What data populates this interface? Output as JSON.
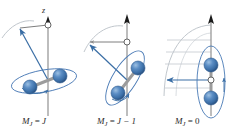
{
  "figure": {
    "title": "",
    "background_color": "#ffffff",
    "width": 241,
    "height": 134
  },
  "colors": {
    "sphere_fill": "#3f74ad",
    "sphere_highlight": "#86aed6",
    "sphere_shadow": "#2b5686",
    "sphere_edge": "#2d5a8e",
    "bond_rod": "#8e8e8e",
    "axis_line": "#8c8c8c",
    "arrowhead_black": "#1a1a1a",
    "vector_blue": "#3a6ea5",
    "ellipse_blue": "#4a7ab5",
    "precession_gray": "#b9bfc6",
    "text": "#2b2b2b",
    "open_circle_fill": "#ffffff"
  },
  "axis": {
    "label": "z",
    "label_x": 46,
    "label_y": 12
  },
  "panels": [
    {
      "id": "panel-mj-equals-j",
      "index": 0,
      "label_parts": {
        "symbol": "M",
        "subscript": "J",
        "equals": " = ",
        "value": "J"
      },
      "label_text": "M J  =  J",
      "label_x": 22,
      "label_y": 124,
      "quantum_number": "M_J = J",
      "origin_x": 48,
      "origin_y": 80,
      "axis_top_y": 20,
      "axis_bottom_y": 116,
      "vector_tip_x": 17,
      "vector_tip_y": 30,
      "ellipse_rx": 33,
      "ellipse_ry": 11,
      "ellipse_rotation": -10,
      "ellipse_cx": 44,
      "ellipse_cy": 81,
      "sphere_a": {
        "cx": 30,
        "cy": 87,
        "r": 7
      },
      "sphere_b": {
        "cx": 60,
        "cy": 76,
        "r": 7
      },
      "open_circle": {
        "cx": 48,
        "cy": 25,
        "r": 3
      },
      "precession_arc": "M2,38 C10,26 22,19 34,21",
      "tilt_degrees": "large"
    },
    {
      "id": "panel-mj-equals-j-minus-1",
      "index": 1,
      "label_parts": {
        "symbol": "M",
        "subscript": "J",
        "equals": " = ",
        "value": "J − 1"
      },
      "label_text": "M J  =  J − 1",
      "label_x": 97,
      "label_y": 124,
      "quantum_number": "M_J = J - 1",
      "origin_x": 127,
      "origin_y": 80,
      "axis_top_y": 18,
      "axis_bottom_y": 116,
      "vector_tip_x": 86,
      "vector_tip_y": 44,
      "ellipse_rx": 31,
      "ellipse_ry": 12,
      "ellipse_rotation": -58,
      "ellipse_cx": 125,
      "ellipse_cy": 78,
      "sphere_a": {
        "cx": 118,
        "cy": 93,
        "r": 7
      },
      "sphere_b": {
        "cx": 138,
        "cy": 68,
        "r": 7
      },
      "open_circle": {
        "cx": 127,
        "cy": 42,
        "r": 3
      },
      "precession_arc": "M84,52 C92,34 108,24 123,26",
      "tilt_degrees": "medium"
    },
    {
      "id": "panel-mj-equals-0",
      "index": 2,
      "label_parts": {
        "symbol": "M",
        "subscript": "J",
        "equals": " = ",
        "value": "0"
      },
      "label_text": "M J  =  0",
      "label_x": 175,
      "label_y": 124,
      "quantum_number": "M_J = 0",
      "origin_x": 211,
      "origin_y": 80,
      "axis_top_y": 18,
      "axis_bottom_y": 116,
      "vector_tip_x": 166,
      "vector_tip_y": 80,
      "ellipse_rx": 14,
      "ellipse_ry": 36,
      "ellipse_rotation": 0,
      "ellipse_cx": 211,
      "ellipse_cy": 82,
      "sphere_a": {
        "cx": 211,
        "cy": 65,
        "r": 7
      },
      "sphere_b": {
        "cx": 211,
        "cy": 98,
        "r": 7
      },
      "open_circle": {
        "cx": 211,
        "cy": 80,
        "r": 3
      },
      "precession_arc": "M164,92 C166,50 186,28 211,26",
      "precession_lines_y": [
        40,
        52,
        64,
        76,
        88
      ],
      "tilt_degrees": "ninety"
    }
  ],
  "legend": {
    "sphere_meaning": "atom",
    "rod_meaning": "chemical bond",
    "vertical_line_meaning": "space-fixed z axis",
    "blue_arrow_meaning": "rotational angular momentum vector J",
    "gray_arc_meaning": "precession cone of J about z"
  }
}
